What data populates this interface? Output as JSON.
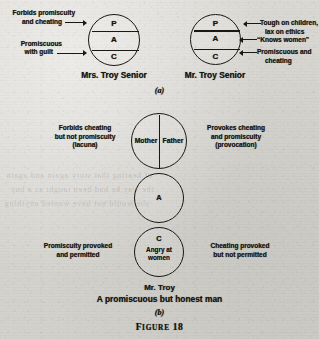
{
  "figure": {
    "caption_prefix": "F",
    "caption_small": "IGURE",
    "caption_number": "18",
    "caption_full": "Figure 18"
  },
  "panel_a": {
    "label": "(a)",
    "left_subject": {
      "name": "Mrs. Troy Senior",
      "segments": [
        {
          "key": "P",
          "letter": "P"
        },
        {
          "key": "A",
          "letter": "A"
        },
        {
          "key": "C",
          "letter": "C"
        }
      ],
      "annotations": [
        {
          "target": "P",
          "line1": "Forbids promiscuity",
          "line2": "and cheating"
        },
        {
          "target": "C",
          "line1": "Promiscuous",
          "line2": "with guilt"
        }
      ]
    },
    "right_subject": {
      "name": "Mr. Troy Senior",
      "segments": [
        {
          "key": "P",
          "letter": "P"
        },
        {
          "key": "A",
          "letter": "A"
        },
        {
          "key": "C",
          "letter": "C"
        }
      ],
      "annotations": [
        {
          "target": "P",
          "line1": "Tough on children,",
          "line2": "lax on ethics"
        },
        {
          "target": "A",
          "line1": "“Knows women”",
          "line2": ""
        },
        {
          "target": "C",
          "line1": "Promiscuous and",
          "line2": "cheating"
        }
      ]
    }
  },
  "panel_b": {
    "label": "(b)",
    "subject_name": "Mr. Troy",
    "tagline": "A promiscuous but honest man",
    "parent_circle": {
      "left_half_label": "Mother",
      "right_half_label": "Father",
      "left_annotation": {
        "line1": "Forbids cheating",
        "line2": "but not promiscuity",
        "line3": "(lacuna)"
      },
      "right_annotation": {
        "line1": "Provokes cheating",
        "line2": "and promiscuity",
        "line3": "(provocation)"
      }
    },
    "adult_circle": {
      "letter": "A"
    },
    "child_circle": {
      "letter": "C",
      "state_line1": "Angry at",
      "state_line2": "women",
      "left_annotation": {
        "line1": "Promiscuity provoked",
        "line2": "and permitted"
      },
      "right_annotation": {
        "line1": "Cheating provoked",
        "line2": "but not permitted"
      }
    }
  },
  "colors": {
    "ink": "#16140f",
    "paper": "#d8d7d3",
    "stroke": "#1a1813"
  },
  "bleed_through": [
    "of hearing that story again and again",
    "the way he had been taught as a boy",
    "she would not have wanted anything"
  ]
}
